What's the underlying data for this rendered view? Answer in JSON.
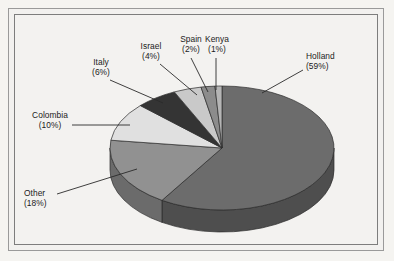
{
  "figure": {
    "background_color": "#f3f2f0",
    "frame_color": "#8a8a8a",
    "text_color": "#1b1b1b"
  },
  "chart_data": {
    "type": "pie",
    "title": "",
    "subtitle": "",
    "xlabel": "",
    "ylabel": "",
    "legend_position": "none",
    "grid": false,
    "three_d": true,
    "start_angle_deg": 0,
    "direction": "clockwise",
    "units": "percent",
    "categories": [
      "Holland",
      "Other",
      "Colombia",
      "Italy",
      "Israel",
      "Spain",
      "Kenya"
    ],
    "values": [
      59,
      18,
      10,
      6,
      4,
      2,
      1
    ],
    "labels": [
      "Holland\n(59%)",
      "Other\n(18%)",
      "Colombia\n(10%)",
      "Italy\n(6%)",
      "Israel\n(4%)",
      "Spain\n(2%)",
      "Kenya\n(1%)"
    ],
    "slices": [
      {
        "name": "Holland",
        "value": 59,
        "percent_text": "(59%)",
        "color": "#6c6c6c",
        "side_color": "#4e4e4e"
      },
      {
        "name": "Other",
        "value": 18,
        "percent_text": "(18%)",
        "color": "#919191",
        "side_color": "#6b6b6b"
      },
      {
        "name": "Colombia",
        "value": 10,
        "percent_text": "(10%)",
        "color": "#e0e0e0",
        "side_color": "#aeaeae"
      },
      {
        "name": "Italy",
        "value": 6,
        "percent_text": "(6%)",
        "color": "#343434",
        "side_color": "#242424"
      },
      {
        "name": "Israel",
        "value": 4,
        "percent_text": "(4%)",
        "color": "#c9c9c9",
        "side_color": "#9a9a9a"
      },
      {
        "name": "Spain",
        "value": 2,
        "percent_text": "(2%)",
        "color": "#8c8c8c",
        "side_color": "#686868"
      },
      {
        "name": "Kenya",
        "value": 1,
        "percent_text": "(1%)",
        "color": "#b5b5b5",
        "side_color": "#8a8a8a"
      }
    ]
  },
  "labels": {
    "holland": {
      "name": "Holland",
      "pct": "(59%)"
    },
    "other": {
      "name": "Other",
      "pct": "(18%)"
    },
    "colombia": {
      "name": "Colombia",
      "pct": "(10%)"
    },
    "italy": {
      "name": "Italy",
      "pct": "(6%)"
    },
    "israel": {
      "name": "Israel",
      "pct": "(4%)"
    },
    "spain": {
      "name": "Spain",
      "pct": "(2%)"
    },
    "kenya": {
      "name": "Kenya",
      "pct": "(1%)"
    }
  }
}
